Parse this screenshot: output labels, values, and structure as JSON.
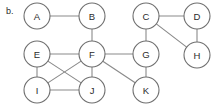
{
  "figure": {
    "panel_label": "b.",
    "caption": "",
    "width": 211,
    "height": 105,
    "background_color": "#ffffff",
    "edge_color": "#8a8a8a",
    "node_stroke_color": "#6f6f6f",
    "node_fill_color": "#ffffff",
    "label_color": "#2b2b2b",
    "node_radius": 13
  },
  "graph_data": {
    "type": "node-link-diagram",
    "directed": false,
    "node_count": 11,
    "edge_count": 15,
    "nodes": [
      {
        "id": "A",
        "label": "A",
        "x": 37,
        "y": 16
      },
      {
        "id": "B",
        "label": "B",
        "x": 92,
        "y": 16
      },
      {
        "id": "C",
        "label": "C",
        "x": 146,
        "y": 16
      },
      {
        "id": "D",
        "label": "D",
        "x": 197,
        "y": 16
      },
      {
        "id": "E",
        "label": "E",
        "x": 37,
        "y": 54
      },
      {
        "id": "F",
        "label": "F",
        "x": 92,
        "y": 54
      },
      {
        "id": "G",
        "label": "G",
        "x": 146,
        "y": 54
      },
      {
        "id": "H",
        "label": "H",
        "x": 197,
        "y": 55
      },
      {
        "id": "I",
        "label": "I",
        "x": 37,
        "y": 90
      },
      {
        "id": "J",
        "label": "J",
        "x": 92,
        "y": 90
      },
      {
        "id": "K",
        "label": "K",
        "x": 146,
        "y": 90
      }
    ],
    "edges": [
      {
        "source": "A",
        "target": "B"
      },
      {
        "source": "B",
        "target": "F"
      },
      {
        "source": "C",
        "target": "D"
      },
      {
        "source": "C",
        "target": "G"
      },
      {
        "source": "C",
        "target": "H"
      },
      {
        "source": "D",
        "target": "H"
      },
      {
        "source": "E",
        "target": "F"
      },
      {
        "source": "E",
        "target": "I"
      },
      {
        "source": "E",
        "target": "J"
      },
      {
        "source": "F",
        "target": "G"
      },
      {
        "source": "F",
        "target": "I"
      },
      {
        "source": "F",
        "target": "J"
      },
      {
        "source": "F",
        "target": "K"
      },
      {
        "source": "G",
        "target": "K"
      },
      {
        "source": "I",
        "target": "J"
      }
    ]
  }
}
